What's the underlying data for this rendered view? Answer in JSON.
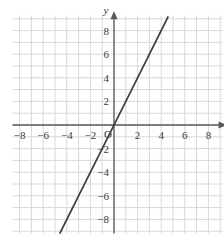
{
  "figure": {
    "title": "",
    "background_color": "#ffffff",
    "grid_color": "#d8d8dc",
    "axis_color": "#5a5a5a",
    "line_color": "#3c3c3c",
    "label_color": "#3b3b3b"
  },
  "axes": {
    "x_axis_name": "x",
    "y_axis_name": "y",
    "origin_label": "O",
    "x_ticks": [
      {
        "value": -8,
        "label": "−8"
      },
      {
        "value": -6,
        "label": "−6"
      },
      {
        "value": -4,
        "label": "−4"
      },
      {
        "value": -2,
        "label": "−2"
      },
      {
        "value": 2,
        "label": "2"
      },
      {
        "value": 4,
        "label": "4"
      },
      {
        "value": 6,
        "label": "6"
      },
      {
        "value": 8,
        "label": "8"
      }
    ],
    "y_ticks": [
      {
        "value": 8,
        "label": "8"
      },
      {
        "value": 6,
        "label": "6"
      },
      {
        "value": 4,
        "label": "4"
      },
      {
        "value": 2,
        "label": "2"
      },
      {
        "value": -2,
        "label": "−2"
      },
      {
        "value": -4,
        "label": "−4"
      },
      {
        "value": -6,
        "label": "−6"
      },
      {
        "value": -8,
        "label": "−8"
      }
    ]
  },
  "chart_data": {
    "type": "line",
    "title": "",
    "xlabel": "x",
    "ylabel": "y",
    "xlim": [
      -8.6,
      9.2
    ],
    "ylim": [
      -9.2,
      9.3
    ],
    "grid": true,
    "grid_step": 1,
    "tick_step": 2,
    "legend": "none",
    "series": [
      {
        "name": "y = 2x",
        "equation": "y = 2x",
        "slope": 2,
        "intercept": 0,
        "x": [
          -4.6,
          4.6
        ],
        "values": [
          -9.2,
          9.2
        ],
        "points": [
          {
            "x": -4,
            "y": -8
          },
          {
            "x": -2,
            "y": -4
          },
          {
            "x": 0,
            "y": 0
          },
          {
            "x": 2,
            "y": 4
          },
          {
            "x": 4,
            "y": 8
          }
        ]
      }
    ]
  }
}
